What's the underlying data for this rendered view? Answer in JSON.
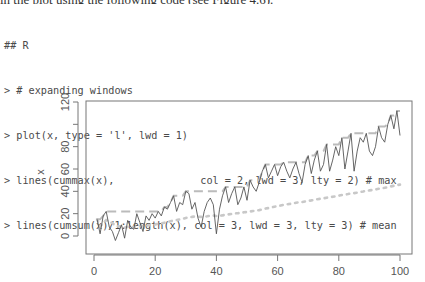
{
  "header": {
    "cutoff_text": "in the plot using the following code (see Figure 4.6)."
  },
  "code": {
    "lines": [
      "## R",
      "> # expanding windows",
      "> plot(x, type = 'l', lwd = 1)",
      "> lines(cummax(x),              col = 2, lwd = 3, lty = 2) # max",
      "> lines(cumsum(x)/1:length(x), col = 3, lwd = 3, lty = 3) # mean"
    ]
  },
  "chart_data": {
    "type": "line",
    "title": "",
    "xlabel": "",
    "ylabel": "x",
    "xlim": [
      0,
      100
    ],
    "ylim": [
      -8,
      124
    ],
    "x_ticks": [
      0,
      20,
      40,
      60,
      80,
      100
    ],
    "x_tick_labels": [
      "0",
      "20",
      "40",
      "60",
      "80",
      "100"
    ],
    "y_ticks": [
      0,
      20,
      40,
      60,
      80,
      100,
      120
    ],
    "y_tick_labels": [
      "0",
      "20",
      "40",
      "60",
      "80",
      "",
      "120"
    ],
    "grid": false,
    "legend": null,
    "series": [
      {
        "name": "x",
        "style": "solid",
        "lwd": 1,
        "color": "#555555",
        "values": [
          15,
          2,
          18,
          22,
          8,
          4,
          -4,
          3,
          10,
          -2,
          14,
          8,
          6,
          20,
          12,
          4,
          18,
          14,
          20,
          16,
          22,
          18,
          26,
          24,
          30,
          36,
          22,
          30,
          28,
          40,
          38,
          24,
          30,
          16,
          8,
          22,
          30,
          34,
          28,
          2,
          24,
          36,
          44,
          30,
          38,
          44,
          28,
          34,
          44,
          32,
          50,
          44,
          40,
          48,
          58,
          64,
          52,
          58,
          64,
          54,
          62,
          66,
          58,
          52,
          60,
          66,
          56,
          48,
          64,
          72,
          56,
          68,
          76,
          58,
          64,
          82,
          58,
          68,
          80,
          72,
          88,
          60,
          76,
          92,
          58,
          76,
          88,
          84,
          92,
          76,
          72,
          80,
          98,
          88,
          84,
          100,
          108,
          96,
          112,
          90
        ]
      },
      {
        "name": "cummax(x)",
        "style": "dashed",
        "lwd": 3,
        "color": "#bbbbbb",
        "derived": "cummax"
      },
      {
        "name": "cumsum(x)/1:length(x)",
        "style": "dotted",
        "lwd": 3,
        "color": "#c8c8c8",
        "derived": "cummean"
      }
    ]
  },
  "layout": {
    "frame": {
      "x0": 86,
      "y0": 101,
      "x1": 412,
      "y1": 254
    },
    "x_map": {
      "v0": 0,
      "p0": 94,
      "v1": 100,
      "p1": 400
    },
    "y_map": {
      "v0": 0,
      "p0": 236,
      "v1": 120,
      "p1": 102
    }
  }
}
